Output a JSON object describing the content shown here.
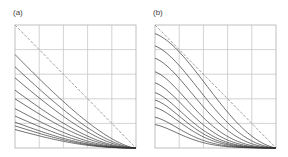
{
  "figure": {
    "panels": [
      {
        "label": "(a)",
        "label_pos": [
          13,
          8
        ],
        "frame": {
          "x": 15,
          "y": 25,
          "w": 121,
          "h": 123
        },
        "grid": {
          "cols": 5,
          "rows": 5
        },
        "reference_line": "dashed diagonal from top-left to bottom-right",
        "curve_start_fractions": [
          0.76,
          0.66,
          0.57,
          0.47,
          0.4,
          0.32,
          0.26,
          0.21,
          0.18,
          0.15
        ],
        "curve_shape": "concave"
      },
      {
        "label": "(b)",
        "label_pos": [
          153,
          8
        ],
        "frame": {
          "x": 155,
          "y": 25,
          "w": 121,
          "h": 123
        },
        "grid": {
          "cols": 5,
          "rows": 5
        },
        "reference_line": "dashed diagonal from top-left to bottom-right",
        "curve_start_fractions": [
          0.93,
          0.83,
          0.73,
          0.62,
          0.53,
          0.45,
          0.39,
          0.33,
          0.25,
          0.19
        ],
        "curve_shape": "sigmoid"
      }
    ],
    "colors": {
      "grid": "#c8c8c8",
      "frame": "#b8b8b8",
      "curve": "#333333",
      "dashed": "#999999"
    }
  },
  "chart_data": [
    {
      "type": "line",
      "title": "(a)",
      "xlabel": "",
      "ylabel": "",
      "xlim": [
        0,
        1
      ],
      "ylim": [
        0,
        1
      ],
      "grid": true,
      "series": [
        {
          "name": "reference (dashed)",
          "x": [
            0,
            1
          ],
          "values": [
            1,
            0
          ]
        },
        {
          "name": "curve 1",
          "start": 0.76
        },
        {
          "name": "curve 2",
          "start": 0.66
        },
        {
          "name": "curve 3",
          "start": 0.57
        },
        {
          "name": "curve 4",
          "start": 0.47
        },
        {
          "name": "curve 5",
          "start": 0.4
        },
        {
          "name": "curve 6",
          "start": 0.32
        },
        {
          "name": "curve 7",
          "start": 0.26
        },
        {
          "name": "curve 8",
          "start": 0.21
        },
        {
          "name": "curve 9",
          "start": 0.18
        },
        {
          "name": "curve 10",
          "start": 0.15
        }
      ]
    },
    {
      "type": "line",
      "title": "(b)",
      "xlabel": "",
      "ylabel": "",
      "xlim": [
        0,
        1
      ],
      "ylim": [
        0,
        1
      ],
      "grid": true,
      "series": [
        {
          "name": "reference (dashed)",
          "x": [
            0,
            1
          ],
          "values": [
            1,
            0
          ]
        },
        {
          "name": "curve 1",
          "start": 0.93
        },
        {
          "name": "curve 2",
          "start": 0.83
        },
        {
          "name": "curve 3",
          "start": 0.73
        },
        {
          "name": "curve 4",
          "start": 0.62
        },
        {
          "name": "curve 5",
          "start": 0.53
        },
        {
          "name": "curve 6",
          "start": 0.45
        },
        {
          "name": "curve 7",
          "start": 0.39
        },
        {
          "name": "curve 8",
          "start": 0.33
        },
        {
          "name": "curve 9",
          "start": 0.25
        },
        {
          "name": "curve 10",
          "start": 0.19
        }
      ]
    }
  ]
}
